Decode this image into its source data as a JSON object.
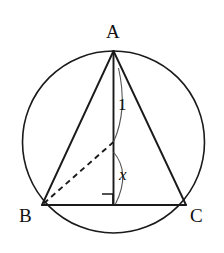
{
  "figure": {
    "background_color": "#ffffff",
    "stroke_color": "#1a1a1a",
    "canvas": {
      "width": 224,
      "height": 253
    }
  },
  "circle": {
    "name": "circumscribed-circle",
    "center_x": 113.5,
    "center_y": 142,
    "radius": 91,
    "stroke_width": 1.6
  },
  "points": {
    "A": {
      "label": "A",
      "x": 113.5,
      "y": 51,
      "label_x": 112,
      "label_y": 34
    },
    "B": {
      "label": "B",
      "x": 42,
      "y": 205,
      "label_x": 27,
      "label_y": 219
    },
    "C": {
      "label": "C",
      "x": 186,
      "y": 205,
      "label_x": 196,
      "label_y": 219
    },
    "O": {
      "label": "",
      "x": 113.5,
      "y": 142
    },
    "M": {
      "label": "",
      "x": 113.5,
      "y": 205
    }
  },
  "segments": [
    {
      "name": "segment-AB",
      "from": "A",
      "to": "B",
      "style": "solid",
      "stroke_width": 1.8
    },
    {
      "name": "segment-AC",
      "from": "A",
      "to": "C",
      "style": "solid",
      "stroke_width": 1.8
    },
    {
      "name": "segment-BC",
      "from": "B",
      "to": "C",
      "style": "solid",
      "stroke_width": 1.8
    },
    {
      "name": "segment-A-to-foot",
      "from": "A",
      "to": "M",
      "style": "solid",
      "stroke_width": 1.8
    },
    {
      "name": "segment-OB-radius",
      "from": "O",
      "to": "B",
      "style": "dashed",
      "stroke_width": 1.8
    }
  ],
  "labels": {
    "radius_label": "1",
    "radius_label_x": 121,
    "radius_label_y": 108,
    "angle_label": "x",
    "angle_label_x": 121,
    "angle_label_y": 178
  },
  "marks": {
    "right_angle": {
      "name": "right-angle-mark",
      "x": 102,
      "y": 194,
      "size": 11
    },
    "arc_top": {
      "name": "angle-arc-at-apex",
      "path": "M 118.5 68 Q 127 112 113.5 142"
    },
    "arc_center": {
      "name": "angle-arc-x-at-center",
      "path": "M 113.5 152 Q 130 172 116 204"
    }
  }
}
